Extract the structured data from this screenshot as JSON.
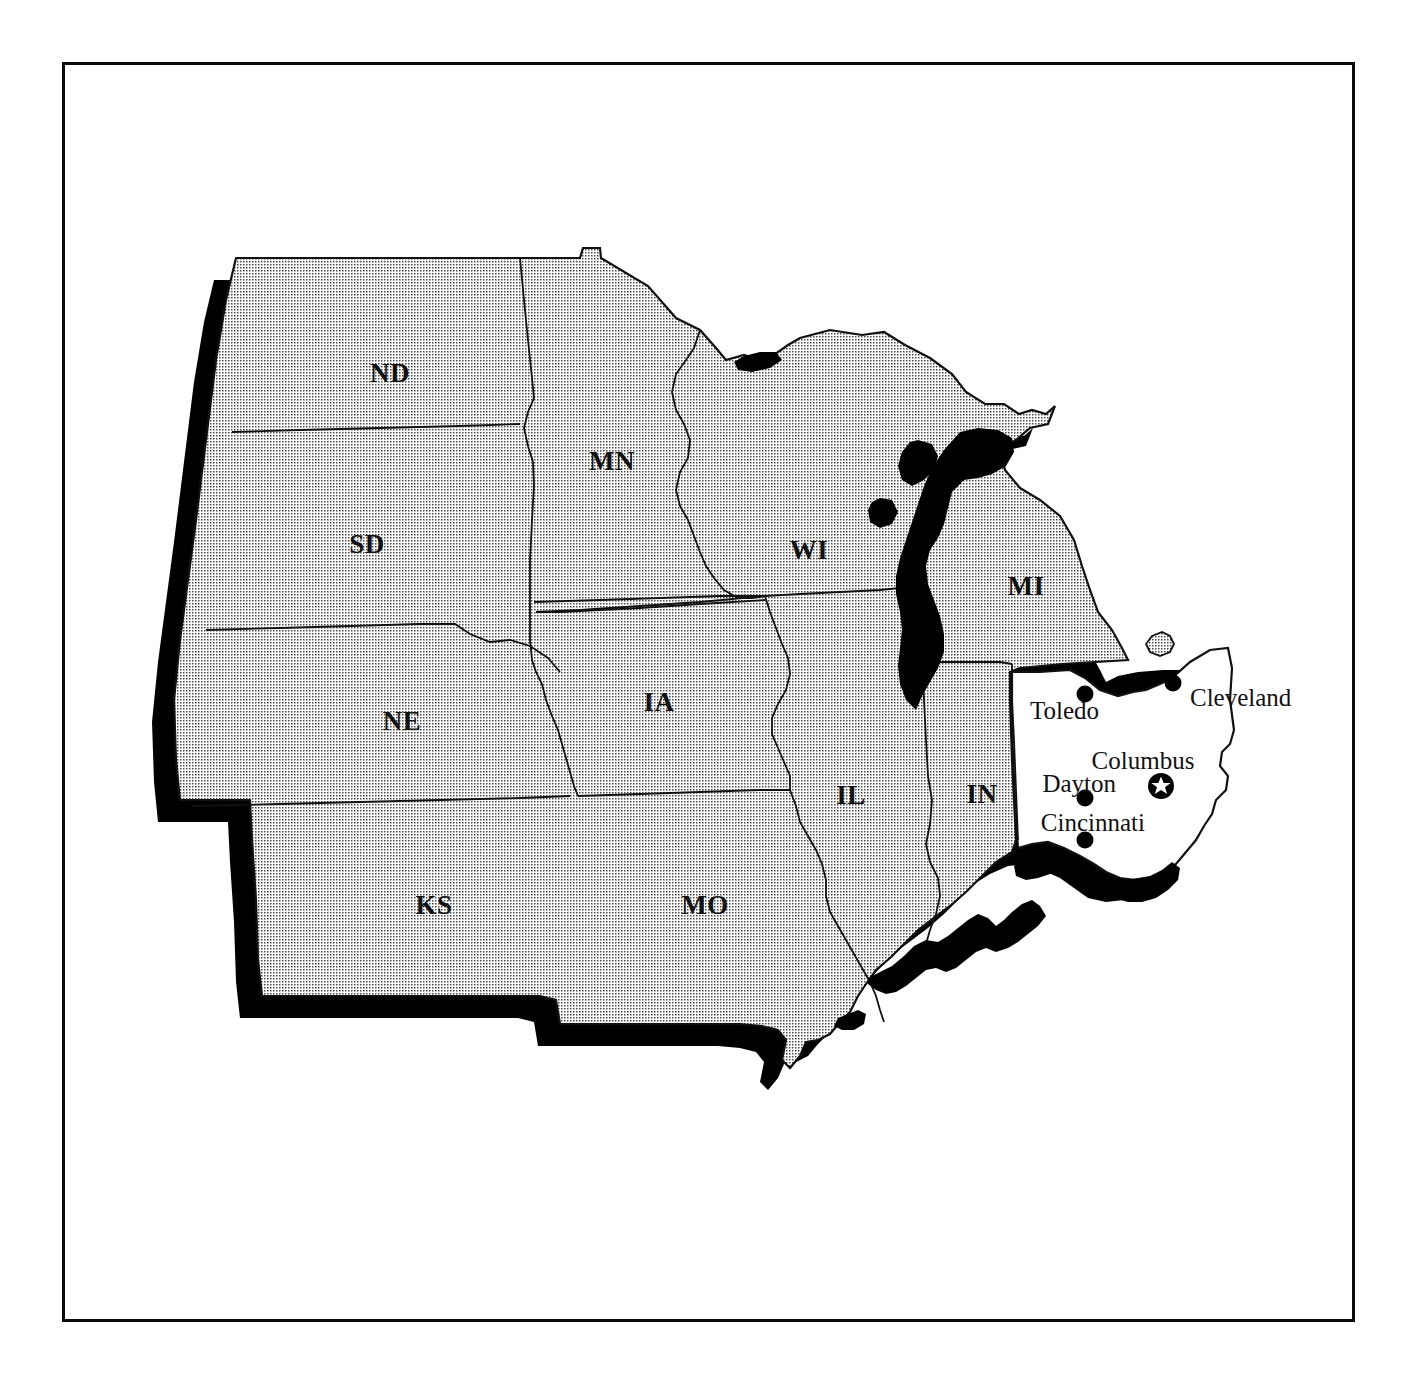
{
  "figure": {
    "kind": "reference-map",
    "title": "",
    "frame_border_color": "#0b0b0b",
    "background_color": "#ffffff"
  },
  "map": {
    "region_name": "Midwestern United States",
    "highlighted_state": "OH",
    "shaded_fill_color": "#cfcfcf",
    "water_fill_color": "#000000",
    "highlight_fill_color": "#ffffff",
    "shadow_color": "#000000",
    "outline_color": "#111111",
    "state_labels": [
      {
        "code": "ND",
        "x": 390,
        "y": 376
      },
      {
        "code": "MN",
        "x": 612,
        "y": 464
      },
      {
        "code": "SD",
        "x": 367,
        "y": 547
      },
      {
        "code": "WI",
        "x": 809,
        "y": 553
      },
      {
        "code": "MI",
        "x": 1026,
        "y": 589
      },
      {
        "code": "NE",
        "x": 402,
        "y": 724
      },
      {
        "code": "IA",
        "x": 659,
        "y": 705
      },
      {
        "code": "IL",
        "x": 851,
        "y": 798
      },
      {
        "code": "IN",
        "x": 982,
        "y": 797
      },
      {
        "code": "KS",
        "x": 434,
        "y": 908
      },
      {
        "code": "MO",
        "x": 705,
        "y": 908
      }
    ],
    "cities": [
      {
        "name": "Toledo",
        "dot_x": 1085,
        "dot_y": 694,
        "label_x": 1099,
        "label_y": 713,
        "label_anchor": "end",
        "marker": "dot"
      },
      {
        "name": "Cleveland",
        "dot_x": 1173,
        "dot_y": 683,
        "label_x": 1190,
        "label_y": 700,
        "label_anchor": "start",
        "marker": "dot"
      },
      {
        "name": "Columbus",
        "dot_x": 1161,
        "dot_y": 786,
        "label_x": 1143,
        "label_y": 763,
        "label_anchor": "middle",
        "marker": "star"
      },
      {
        "name": "Dayton",
        "dot_x": 1085,
        "dot_y": 798,
        "label_x": 1116,
        "label_y": 786,
        "label_anchor": "end",
        "marker": "dot"
      },
      {
        "name": "Cincinnati",
        "dot_x": 1085,
        "dot_y": 840,
        "label_x": 1145,
        "label_y": 825,
        "label_anchor": "end",
        "marker": "dot"
      }
    ],
    "legend_note": "",
    "scale_note": ""
  }
}
